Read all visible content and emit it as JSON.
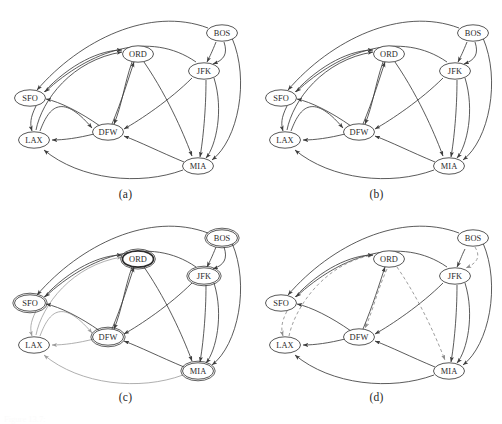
{
  "figure": {
    "caption_clipped": "Figure 13.7:",
    "panels": [
      {
        "id": "a",
        "caption": "(a)"
      },
      {
        "id": "b",
        "caption": "(b)"
      },
      {
        "id": "c",
        "caption": "(c)"
      },
      {
        "id": "d",
        "caption": "(d)"
      }
    ]
  },
  "colors": {
    "background": "#ffffff",
    "node_stroke": "#3a3a3a",
    "node_fill": "#ffffff",
    "edge": "#3d3d3d",
    "edge_faded": "#9b9b9b",
    "edge_dashed": "#8d8d8d",
    "label": "#2b2b2b"
  },
  "nodes": {
    "SFO": {
      "label": "SFO"
    },
    "LAX": {
      "label": "LAX"
    },
    "ORD": {
      "label": "ORD"
    },
    "DFW": {
      "label": "DFW"
    },
    "JFK": {
      "label": "JFK"
    },
    "BOS": {
      "label": "BOS"
    },
    "MIA": {
      "label": "MIA"
    }
  },
  "node_positions": {
    "SFO": {
      "x": 30,
      "y": 98
    },
    "LAX": {
      "x": 34,
      "y": 140
    },
    "ORD": {
      "x": 138,
      "y": 54
    },
    "DFW": {
      "x": 108,
      "y": 132
    },
    "JFK": {
      "x": 204,
      "y": 71
    },
    "BOS": {
      "x": 222,
      "y": 33
    },
    "MIA": {
      "x": 198,
      "y": 166
    }
  },
  "node_size": {
    "rx": 15.5,
    "ry": 8.2
  },
  "graph_edges": [
    {
      "from": "BOS",
      "to": "SFO",
      "style": "solid"
    },
    {
      "from": "BOS",
      "to": "JFK",
      "style": "solid"
    },
    {
      "from": "BOS",
      "to": "MIA",
      "style": "solid"
    },
    {
      "from": "JFK",
      "to": "BOS",
      "style": "solid"
    },
    {
      "from": "JFK",
      "to": "DFW",
      "style": "solid"
    },
    {
      "from": "JFK",
      "to": "MIA",
      "style": "solid"
    },
    {
      "from": "JFK",
      "to": "SFO",
      "style": "solid"
    },
    {
      "from": "MIA",
      "to": "BOS",
      "style": "solid"
    },
    {
      "from": "MIA",
      "to": "DFW",
      "style": "solid"
    },
    {
      "from": "MIA",
      "to": "LAX",
      "style": "solid"
    },
    {
      "from": "DFW",
      "to": "ORD",
      "style": "solid"
    },
    {
      "from": "DFW",
      "to": "LAX",
      "style": "solid"
    },
    {
      "from": "ORD",
      "to": "DFW",
      "style": "solid"
    },
    {
      "from": "ORD",
      "to": "MIA",
      "style": "solid"
    },
    {
      "from": "LAX",
      "to": "ORD",
      "style": "solid"
    },
    {
      "from": "SFO",
      "to": "ORD",
      "style": "solid"
    },
    {
      "from": "SFO",
      "to": "LAX",
      "style": "solid"
    },
    {
      "from": "DFW",
      "to": "SFO",
      "style": "solid"
    }
  ],
  "panel_notes": {
    "a": "all edges solid black",
    "b": "all edges solid black, same layout",
    "c": "ORD node emphasized with bold outline; LAX outgoing edges drawn light gray",
    "d": "tree edges solid; non-tree edges dashed gray (LAX-ORD, ORD-DFW, ORD-MIA, BOS-JFK)"
  }
}
